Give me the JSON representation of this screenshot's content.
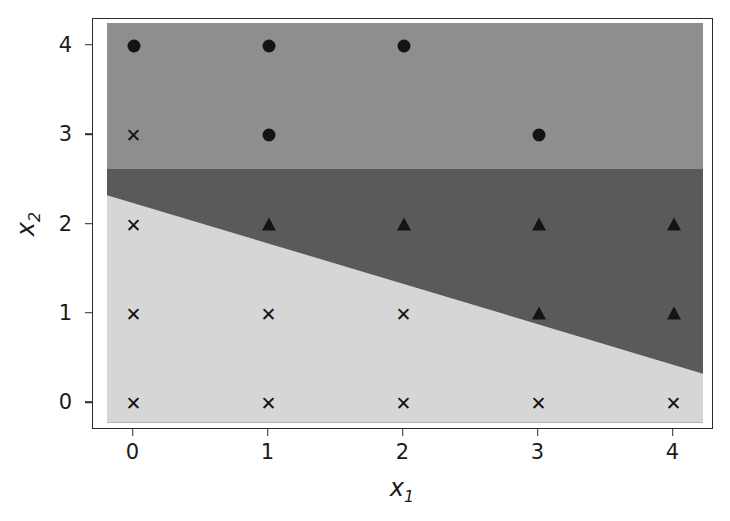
{
  "chart_data": {
    "type": "scatter",
    "title": "",
    "xlabel": "x1",
    "ylabel": "x2",
    "xlabel_base": "x",
    "xlabel_sub": "1",
    "ylabel_base": "x",
    "ylabel_sub": "2",
    "xlim": [
      -0.3,
      4.3
    ],
    "ylim": [
      -0.3,
      4.3
    ],
    "xticks": [
      0,
      1,
      2,
      3,
      4
    ],
    "yticks": [
      0,
      1,
      2,
      3,
      4
    ],
    "xticklabels": [
      "0",
      "1",
      "2",
      "3",
      "4"
    ],
    "yticklabels": [
      "0",
      "1",
      "2",
      "3",
      "4"
    ],
    "grid": false,
    "legend": "none",
    "background_colors": {
      "region_class_0_light": "#d6d6d6",
      "region_class_1_dark": "#5a5a5a",
      "region_class_2_medium": "#8e8e8e",
      "figure": "#ffffff",
      "spine": "#2b2b2b",
      "marker": "#141414"
    },
    "decision_regions": [
      {
        "name": "upper-region-medium-gray",
        "color": "#8e8e8e",
        "description": "top band spanning full width above y approx 2.62"
      },
      {
        "name": "middle-region-dark-gray",
        "color": "#5a5a5a",
        "description": "wedge between y approx 2.62 and the descending diagonal boundary"
      },
      {
        "name": "lower-region-light-gray",
        "color": "#d6d6d6",
        "description": "lower-left region under the diagonal boundary"
      }
    ],
    "series": [
      {
        "name": "class-circle",
        "marker": "circle",
        "color": "#141414",
        "points": [
          {
            "x": 0,
            "y": 4
          },
          {
            "x": 1,
            "y": 4
          },
          {
            "x": 2,
            "y": 4
          },
          {
            "x": 1,
            "y": 3
          },
          {
            "x": 3,
            "y": 3
          }
        ]
      },
      {
        "name": "class-triangle",
        "marker": "triangle",
        "color": "#141414",
        "points": [
          {
            "x": 1,
            "y": 2
          },
          {
            "x": 2,
            "y": 2
          },
          {
            "x": 3,
            "y": 2
          },
          {
            "x": 4,
            "y": 2
          },
          {
            "x": 3,
            "y": 1
          },
          {
            "x": 4,
            "y": 1
          }
        ]
      },
      {
        "name": "class-cross",
        "marker": "cross",
        "glyph": "✕",
        "color": "#141414",
        "points": [
          {
            "x": 0,
            "y": 3
          },
          {
            "x": 0,
            "y": 2
          },
          {
            "x": 0,
            "y": 1
          },
          {
            "x": 1,
            "y": 1
          },
          {
            "x": 2,
            "y": 1
          },
          {
            "x": 0,
            "y": 0
          },
          {
            "x": 1,
            "y": 0
          },
          {
            "x": 2,
            "y": 0
          },
          {
            "x": 3,
            "y": 0
          },
          {
            "x": 4,
            "y": 0
          }
        ]
      }
    ]
  }
}
